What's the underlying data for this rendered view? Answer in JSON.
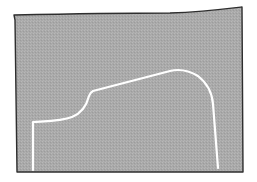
{
  "illustration": {
    "background": "#ffffff",
    "panel_fill": "#aaaaaa",
    "panel_border": "#2e2e2e",
    "curve_color": "#ffffff",
    "description": "hand-drawn gray rectangle containing a white outline curve"
  }
}
